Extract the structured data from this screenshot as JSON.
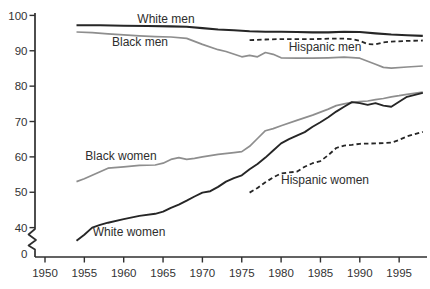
{
  "chart_data": {
    "type": "line",
    "title": "",
    "xlabel": "",
    "ylabel": "",
    "x_ticks": [
      1950,
      1955,
      1960,
      1965,
      1970,
      1975,
      1980,
      1985,
      1990,
      1995
    ],
    "y_ticks": [
      100,
      90,
      80,
      70,
      60,
      50,
      40,
      0
    ],
    "y_axis_break": true,
    "grid": false,
    "legend": "inline-labels",
    "axis_color": "#2f2f2f",
    "text_color": "#333333",
    "xlim": [
      1948.7,
      1998.5
    ],
    "ylim": [
      0,
      100
    ],
    "layout": {
      "x0": 45,
      "x0_year": 1950,
      "px_per_year": 7.87,
      "y_top": 15.4,
      "y_top_value": 100,
      "px_per_value": 3.537,
      "axis_x": 35,
      "axis_top": 13,
      "axis_y": 257,
      "axis_right": 427,
      "y_tick_len": 5.5,
      "x_tick_len": 5.5
    },
    "series": [
      {
        "id": "black-men",
        "name": "Black men",
        "color": "#8e8e8e",
        "width": 1.7,
        "dash": "",
        "label_px": [
          140,
          46
        ],
        "points": [
          [
            1954,
            95.3
          ],
          [
            1956,
            95.1
          ],
          [
            1958,
            94.8
          ],
          [
            1960,
            94.5
          ],
          [
            1962,
            94.2
          ],
          [
            1964,
            94.0
          ],
          [
            1966,
            93.9
          ],
          [
            1968,
            93.5
          ],
          [
            1970,
            91.8
          ],
          [
            1972,
            90.3
          ],
          [
            1973,
            89.8
          ],
          [
            1975,
            88.3
          ],
          [
            1976,
            88.7
          ],
          [
            1977,
            88.3
          ],
          [
            1978,
            89.5
          ],
          [
            1979,
            89.0
          ],
          [
            1980,
            88.0
          ],
          [
            1982,
            87.9
          ],
          [
            1984,
            87.9
          ],
          [
            1986,
            88.0
          ],
          [
            1988,
            88.2
          ],
          [
            1990,
            87.9
          ],
          [
            1992,
            86.2
          ],
          [
            1993,
            85.3
          ],
          [
            1994,
            85.1
          ],
          [
            1996,
            85.4
          ],
          [
            1998,
            85.7
          ]
        ]
      },
      {
        "id": "white-men",
        "name": "White men",
        "color": "#262626",
        "width": 2.1,
        "dash": "",
        "label_px": [
          166,
          23
        ],
        "points": [
          [
            1954,
            97.2
          ],
          [
            1957,
            97.2
          ],
          [
            1960,
            97.1
          ],
          [
            1963,
            97.0
          ],
          [
            1966,
            96.9
          ],
          [
            1968,
            96.8
          ],
          [
            1970,
            96.4
          ],
          [
            1972,
            96.0
          ],
          [
            1974,
            95.8
          ],
          [
            1976,
            95.5
          ],
          [
            1978,
            95.4
          ],
          [
            1980,
            95.4
          ],
          [
            1982,
            95.3
          ],
          [
            1984,
            95.2
          ],
          [
            1986,
            95.2
          ],
          [
            1988,
            95.4
          ],
          [
            1990,
            95.3
          ],
          [
            1992,
            94.9
          ],
          [
            1994,
            94.6
          ],
          [
            1996,
            94.4
          ],
          [
            1998,
            94.2
          ]
        ]
      },
      {
        "id": "black-women",
        "name": "Black women",
        "color": "#8e8e8e",
        "width": 1.7,
        "dash": "",
        "label_px": [
          121,
          160
        ],
        "points": [
          [
            1954,
            53.0
          ],
          [
            1955,
            53.8
          ],
          [
            1956,
            54.8
          ],
          [
            1957,
            55.8
          ],
          [
            1958,
            56.8
          ],
          [
            1960,
            57.2
          ],
          [
            1962,
            57.6
          ],
          [
            1964,
            57.7
          ],
          [
            1965,
            58.2
          ],
          [
            1966,
            59.3
          ],
          [
            1967,
            59.8
          ],
          [
            1968,
            59.3
          ],
          [
            1969,
            59.6
          ],
          [
            1970,
            60.0
          ],
          [
            1972,
            60.7
          ],
          [
            1974,
            61.2
          ],
          [
            1975,
            61.5
          ],
          [
            1976,
            63.0
          ],
          [
            1977,
            65.2
          ],
          [
            1978,
            67.4
          ],
          [
            1979,
            68.0
          ],
          [
            1980,
            68.8
          ],
          [
            1982,
            70.3
          ],
          [
            1984,
            71.8
          ],
          [
            1986,
            73.5
          ],
          [
            1987,
            74.5
          ],
          [
            1988,
            75.0
          ],
          [
            1989,
            75.4
          ],
          [
            1990,
            75.6
          ],
          [
            1991,
            75.8
          ],
          [
            1992,
            76.2
          ],
          [
            1993,
            76.5
          ],
          [
            1994,
            77.0
          ],
          [
            1995,
            77.3
          ],
          [
            1996,
            77.7
          ],
          [
            1998,
            78.3
          ]
        ]
      },
      {
        "id": "white-women",
        "name": "White women",
        "color": "#262626",
        "width": 1.9,
        "dash": "",
        "label_px": [
          129,
          236
        ],
        "points": [
          [
            1954,
            36.3
          ],
          [
            1955,
            38.0
          ],
          [
            1956,
            40.0
          ],
          [
            1957,
            40.8
          ],
          [
            1958,
            41.4
          ],
          [
            1960,
            42.4
          ],
          [
            1962,
            43.3
          ],
          [
            1964,
            43.9
          ],
          [
            1965,
            44.5
          ],
          [
            1966,
            45.6
          ],
          [
            1967,
            46.5
          ],
          [
            1968,
            47.6
          ],
          [
            1969,
            48.8
          ],
          [
            1970,
            49.9
          ],
          [
            1971,
            50.3
          ],
          [
            1972,
            51.5
          ],
          [
            1973,
            53.0
          ],
          [
            1974,
            54.0
          ],
          [
            1975,
            54.8
          ],
          [
            1976,
            56.5
          ],
          [
            1977,
            58.0
          ],
          [
            1978,
            59.8
          ],
          [
            1979,
            61.8
          ],
          [
            1980,
            63.8
          ],
          [
            1981,
            65.0
          ],
          [
            1982,
            66.0
          ],
          [
            1983,
            67.0
          ],
          [
            1984,
            68.5
          ],
          [
            1985,
            69.8
          ],
          [
            1986,
            71.2
          ],
          [
            1987,
            72.8
          ],
          [
            1988,
            74.2
          ],
          [
            1989,
            75.5
          ],
          [
            1990,
            75.2
          ],
          [
            1991,
            74.7
          ],
          [
            1992,
            75.2
          ],
          [
            1993,
            74.5
          ],
          [
            1994,
            74.2
          ],
          [
            1995,
            75.6
          ],
          [
            1996,
            77.0
          ],
          [
            1998,
            78.1
          ]
        ]
      },
      {
        "id": "hispanic-men",
        "name": "Hispanic men",
        "color": "#262626",
        "width": 1.8,
        "dash": "4.5 3",
        "label_px": [
          325,
          51
        ],
        "points": [
          [
            1976,
            93.0
          ],
          [
            1978,
            93.2
          ],
          [
            1980,
            93.3
          ],
          [
            1982,
            93.3
          ],
          [
            1984,
            93.3
          ],
          [
            1986,
            93.4
          ],
          [
            1988,
            93.4
          ],
          [
            1989,
            93.3
          ],
          [
            1990,
            92.8
          ],
          [
            1991,
            91.9
          ],
          [
            1992,
            91.8
          ],
          [
            1993,
            92.4
          ],
          [
            1994,
            92.6
          ],
          [
            1996,
            92.8
          ],
          [
            1998,
            92.9
          ]
        ]
      },
      {
        "id": "hispanic-women",
        "name": "Hispanic women",
        "color": "#262626",
        "width": 1.8,
        "dash": "4.5 3",
        "label_px": [
          325,
          184
        ],
        "points": [
          [
            1976,
            49.9
          ],
          [
            1977,
            51.2
          ],
          [
            1978,
            52.8
          ],
          [
            1979,
            54.2
          ],
          [
            1980,
            55.3
          ],
          [
            1981,
            55.6
          ],
          [
            1982,
            55.8
          ],
          [
            1983,
            57.2
          ],
          [
            1984,
            58.2
          ],
          [
            1985,
            58.8
          ],
          [
            1986,
            60.5
          ],
          [
            1987,
            62.5
          ],
          [
            1988,
            63.2
          ],
          [
            1989,
            63.4
          ],
          [
            1990,
            63.7
          ],
          [
            1992,
            63.8
          ],
          [
            1993,
            63.9
          ],
          [
            1994,
            64.0
          ],
          [
            1995,
            64.8
          ],
          [
            1996,
            65.8
          ],
          [
            1998,
            67.1
          ]
        ]
      }
    ]
  }
}
